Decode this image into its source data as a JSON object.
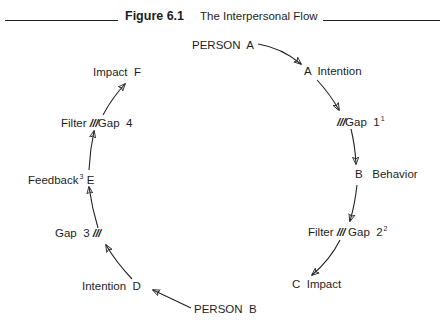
{
  "header": {
    "figure_label": "Figure 6.1",
    "title": "The Interpersonal Flow"
  },
  "nodes": {
    "person_a": {
      "text": "PERSON  A"
    },
    "a_intention": {
      "text": "A  Intention"
    },
    "gap1": {
      "slashes": "///",
      "text": "Gap  1",
      "footnote": "1"
    },
    "b_behavior": {
      "text": "B   Behavior"
    },
    "gap2": {
      "prefix": "Filter",
      "slashes": "///",
      "text": "Gap  2",
      "footnote": "2"
    },
    "c_impact": {
      "text": "C  Impact"
    },
    "person_b": {
      "text": "PERSON  B"
    },
    "intention_d": {
      "text": "Intention  D"
    },
    "gap3": {
      "text": "Gap  3",
      "slashes": "///"
    },
    "feedback_e": {
      "text": "Feedback",
      "footnote": "3",
      "suffix": "E"
    },
    "gap4": {
      "prefix": "Filter",
      "slashes": "///",
      "text": "Gap  4"
    },
    "impact_f": {
      "text": "Impact  F"
    }
  },
  "flow_order": [
    "PERSON A",
    "A Intention",
    "Gap 1",
    "B Behavior",
    "Filter Gap 2",
    "C Impact",
    "PERSON B",
    "Intention D",
    "Gap 3",
    "Feedback E",
    "Filter Gap 4",
    "Impact F"
  ]
}
